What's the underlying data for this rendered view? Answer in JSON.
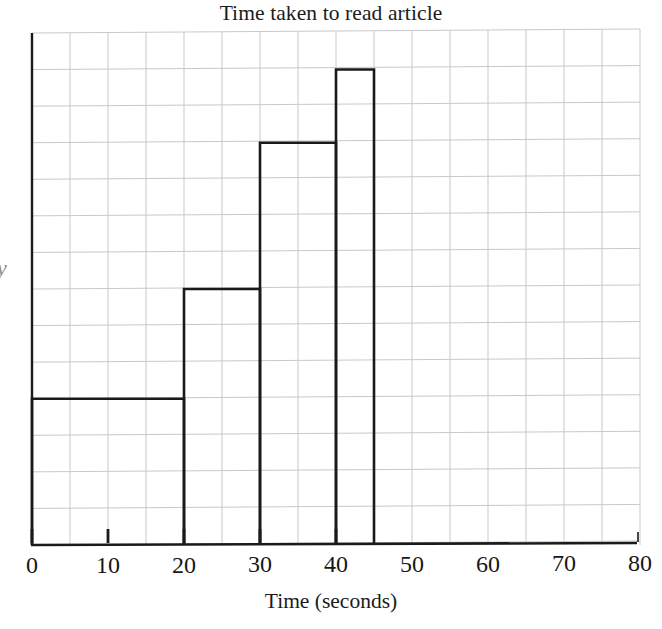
{
  "chart_data": {
    "type": "bar",
    "title": "Time taken to read article",
    "xlabel": "Time (seconds)",
    "ylabel": "y",
    "grid": true,
    "legend": "none",
    "xlim": [
      0,
      80
    ],
    "ylim": [
      0,
      14
    ],
    "x_ticks": [
      {
        "value": 0,
        "label": "0",
        "major": true
      },
      {
        "value": 10,
        "label": "10",
        "major": true
      },
      {
        "value": 20,
        "label": "20",
        "major": true
      },
      {
        "value": 30,
        "label": "30",
        "major": true
      },
      {
        "value": 40,
        "label": "40",
        "major": true
      },
      {
        "value": 50,
        "label": "50",
        "major": false
      },
      {
        "value": 60,
        "label": "60",
        "major": false
      },
      {
        "value": 70,
        "label": "70",
        "major": false
      },
      {
        "value": 80,
        "label": "80",
        "major": false
      }
    ],
    "grid_columns": 16,
    "grid_rows": 14,
    "grid_cell_x_units": 5,
    "grid_cell_y_units": 1,
    "bins": [
      {
        "label": "0-20",
        "x_start": 0,
        "x_end": 20,
        "height": 4
      },
      {
        "label": "20-30",
        "x_start": 20,
        "x_end": 30,
        "height": 7
      },
      {
        "label": "30-40",
        "x_start": 30,
        "x_end": 40,
        "height": 11
      },
      {
        "label": "40-45",
        "x_start": 40,
        "x_end": 45,
        "height": 13
      }
    ],
    "categories": [
      "0-20",
      "20-30",
      "30-40",
      "40-45"
    ],
    "values": [
      4,
      7,
      11,
      13
    ],
    "colors": {
      "bar_outline": "#1a1a1a",
      "bar_fill": "none",
      "axis": "#1a1a1a",
      "grid": "#c9c9c9",
      "background": "#ffffff",
      "text": "#1b1b1b"
    }
  }
}
